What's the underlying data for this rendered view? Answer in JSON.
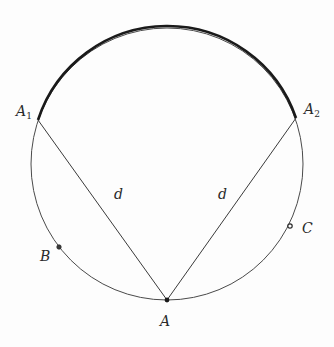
{
  "diagram": {
    "type": "circle-geometry",
    "circle": {
      "cx": 167,
      "cy": 164,
      "r": 136
    },
    "colors": {
      "stroke": "#3a3a3a",
      "thick_arc": "#1a1a1a",
      "background": "#fdfdfd"
    },
    "points": {
      "A1": {
        "label": "A",
        "sub": "1",
        "x": 38,
        "y": 120
      },
      "A2": {
        "label": "A",
        "sub": "2",
        "x": 296,
        "y": 118
      },
      "A": {
        "label": "A",
        "x": 167,
        "y": 300
      },
      "B": {
        "label": "B",
        "x": 59,
        "y": 247
      },
      "C": {
        "label": "C",
        "x": 290,
        "y": 226
      }
    },
    "segments": [
      {
        "from": "A",
        "to": "A1",
        "label": "d"
      },
      {
        "from": "A",
        "to": "A2",
        "label": "d"
      }
    ],
    "thick_arc": {
      "from": "A1",
      "to": "A2",
      "via": "top"
    }
  }
}
